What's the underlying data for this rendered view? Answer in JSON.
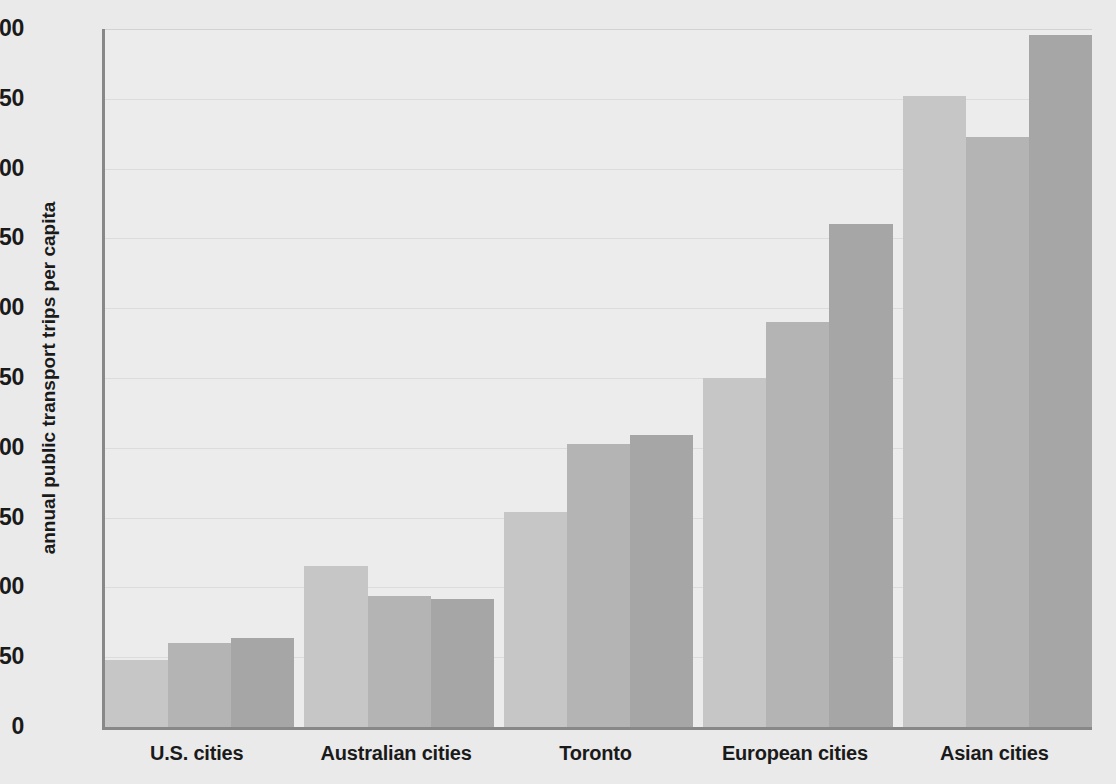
{
  "chart_data": {
    "type": "bar",
    "title": "",
    "subtitle": "",
    "xlabel": "",
    "ylabel": "annual public transport trips per capita",
    "ylim": [
      0,
      500
    ],
    "ytick_labels": [
      "0",
      "50",
      "100",
      "150",
      "200",
      "250",
      "300",
      "350",
      "400",
      "450",
      "500"
    ],
    "ytick_values": [
      0,
      50,
      100,
      150,
      200,
      250,
      300,
      350,
      400,
      450,
      500
    ],
    "grid": true,
    "grid_axis": "y",
    "legend": "none",
    "categories": [
      "U.S. cities",
      "Australian cities",
      "Toronto",
      "European cities",
      "Asian cities"
    ],
    "series": [
      {
        "name": "series-1",
        "color": "#c6c6c6",
        "values": [
          48,
          115,
          154,
          250,
          452
        ]
      },
      {
        "name": "series-2",
        "color": "#b4b4b4",
        "values": [
          60,
          94,
          203,
          290,
          423
        ]
      },
      {
        "name": "series-3",
        "color": "#a6a6a6",
        "values": [
          64,
          92,
          209,
          360,
          496
        ]
      }
    ],
    "groups": [
      {
        "label": "U.S. cities",
        "bars": [
          48,
          60,
          64
        ]
      },
      {
        "label": "Australian cities",
        "bars": [
          115,
          94,
          92
        ]
      },
      {
        "label": "Toronto",
        "bars": [
          154,
          203,
          209
        ]
      },
      {
        "label": "European cities",
        "bars": [
          250,
          290,
          360
        ]
      },
      {
        "label": "Asian cities",
        "bars": [
          452,
          423,
          496
        ]
      }
    ]
  },
  "colors": {
    "background": "#eaeaea",
    "plot_background": "#ececec",
    "axis": "#888888",
    "gridline": "#dcdcdc",
    "text": "#1a1a1a",
    "bar_light": "#c6c6c6",
    "bar_medium": "#b4b4b4",
    "bar_dark": "#a6a6a6"
  },
  "axes": {
    "y_label": "annual public transport trips per capita",
    "y_ticks": [
      "500",
      "450",
      "400",
      "350",
      "300",
      "250",
      "200",
      "150",
      "100",
      "50",
      "0"
    ],
    "x_ticks": [
      "U.S. cities",
      "Australian cities",
      "Toronto",
      "European cities",
      "Asian cities"
    ]
  }
}
